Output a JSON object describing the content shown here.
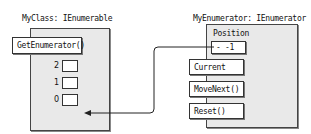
{
  "left_object": {
    "title": "MyClass: IEnumerable",
    "method": "GetEnumerator()",
    "slots": [
      {
        "index": "2"
      },
      {
        "index": "1"
      },
      {
        "index": "0"
      }
    ]
  },
  "right_object": {
    "title": "MyEnumerator: IEnumerator",
    "field_label": "Position",
    "field_value": "- -1",
    "members": [
      "Current",
      "MoveNext()",
      "Reset()"
    ]
  },
  "connector": {
    "from": "Position",
    "to": "MyClass"
  }
}
